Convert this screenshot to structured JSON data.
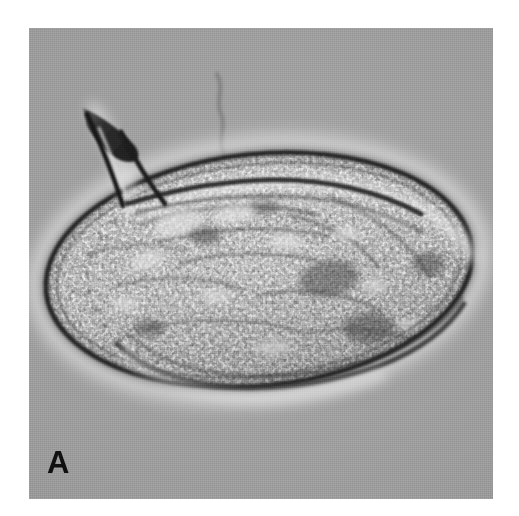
{
  "figure": {
    "panel_label": "A",
    "caption_visible": false,
    "modality": "light-microscopy-dic",
    "canvas": {
      "width": 519,
      "height": 516,
      "background_color": "#ffffff"
    },
    "plate": {
      "x": 29,
      "y": 28,
      "width": 464,
      "height": 471,
      "background_color": "#9d9d9d",
      "description": "uniform gray microscope field"
    }
  },
  "colors": {
    "page_background": "#ffffff",
    "field_gray": "#9d9d9d",
    "field_gray_light": "#aeaeae",
    "field_gray_dark": "#8d8d8d",
    "membrane_dark": "#1f1f1f",
    "membrane_mid": "#3a3a3a",
    "halo_bright": "#e9e9e9",
    "cytoplasm_mid": "#9a9a9a",
    "cytoplasm_light": "#d8d8d8",
    "cytoplasm_dark": "#4e4e4e",
    "horn_dark": "#242424",
    "label_black": "#101010"
  },
  "subject": {
    "name": "unicellular-organism",
    "common_description": "ovoid cell with a single anterior dorsal horn / spine",
    "body": {
      "shape": "ellipse-ovoid",
      "bounds": {
        "x": 45,
        "y": 152,
        "width": 428,
        "height": 236
      },
      "center": {
        "x": 259,
        "y": 270
      },
      "rotation_deg": -6,
      "outline": "thick dark membrane with bright diffraction halo",
      "interior": "dense granular cytoplasm, coarse light and dark inclusions"
    },
    "horn": {
      "name": "anterior-spine",
      "tip": {
        "x": 84,
        "y": 113
      },
      "base": {
        "x": 133,
        "y": 196
      },
      "length_px": 95,
      "appearance": "dark triangular projection with bright central core"
    },
    "debris_filament": {
      "name": "background-debris",
      "bounds": {
        "x": 212,
        "y": 74,
        "width": 24,
        "height": 92
      },
      "appearance": "faint wavy dark thread in the background"
    }
  }
}
